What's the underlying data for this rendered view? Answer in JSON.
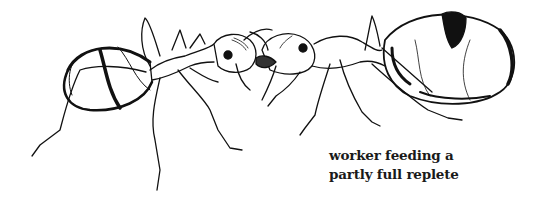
{
  "illustration": {
    "subject": "two ants in trophallaxis",
    "left_figure": "worker ant",
    "right_figure": "partly full replete ant",
    "ink_color": "#111111",
    "background_color": "#ffffff"
  },
  "caption": {
    "line1": "worker feeding a",
    "line2": "partly full replete"
  }
}
